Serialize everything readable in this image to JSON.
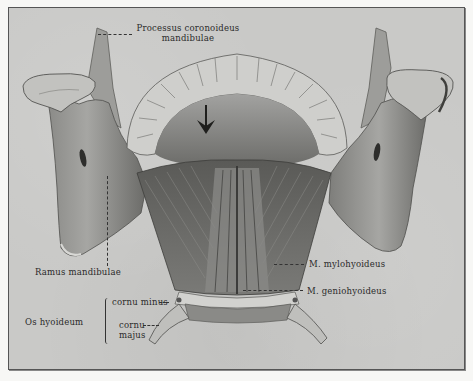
{
  "figure": {
    "colors": {
      "background": "#c9c9c7",
      "page": "#f7f7f5",
      "bone_light": "#d8d8d5",
      "bone_mid": "#a9a9a6",
      "bone_dark": "#6e6e6b",
      "muscle": "#7d7d7a",
      "muscle_dark": "#4e4e4b",
      "ink": "#2a2a2a"
    },
    "arrow": "arrow-down-icon"
  },
  "labels": {
    "processus_line1": "Processus coronoideus",
    "processus_line2": "mandibulae",
    "ramus": "Ramus mandibulae",
    "mylohyoideus": "M. mylohyoideus",
    "geniohyoideus": "M. geniohyoideus",
    "os_hyoideum": "Os hyoideum",
    "cornu_minus": "cornu minus",
    "cornu_majus_line1": "cornu",
    "cornu_majus_line2": "majus"
  }
}
